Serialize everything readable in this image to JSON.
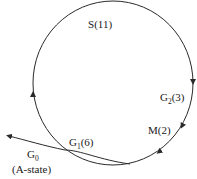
{
  "diagram": {
    "type": "cell-cycle",
    "phases": [
      {
        "id": "S",
        "label": "S",
        "value": "(11)"
      },
      {
        "id": "G2",
        "label": "G",
        "subscript": "2",
        "value": "(3)"
      },
      {
        "id": "M",
        "label": "M",
        "value": "(2)"
      },
      {
        "id": "G1",
        "label": "G",
        "subscript": "1",
        "value": "(6)"
      }
    ],
    "exit": {
      "label": "G",
      "subscript": "0",
      "note": "(A-state)"
    },
    "colors": {
      "line": "#2a2a2a",
      "text": "#1a1a1a"
    }
  }
}
